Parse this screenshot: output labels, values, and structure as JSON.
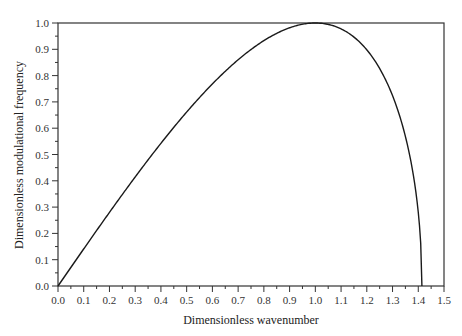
{
  "chart_data": {
    "type": "line",
    "title": "",
    "xlabel": "Dimensionless wavenumber",
    "ylabel": "Dimensionless modulational frequency",
    "xlim": [
      0.0,
      1.5
    ],
    "ylim": [
      0.0,
      1.0
    ],
    "grid": false,
    "legend": null,
    "x_ticks": [
      "0.0",
      "0.1",
      "0.2",
      "0.3",
      "0.4",
      "0.5",
      "0.6",
      "0.7",
      "0.8",
      "0.9",
      "1.0",
      "1.1",
      "1.2",
      "1.3",
      "1.4",
      "1.5"
    ],
    "y_ticks": [
      "0.0",
      "0.1",
      "0.2",
      "0.3",
      "0.4",
      "0.5",
      "0.6",
      "0.7",
      "0.8",
      "0.9",
      "1.0"
    ],
    "series": [
      {
        "name": "modulational frequency",
        "x": [
          0.0,
          0.1,
          0.2,
          0.3,
          0.4,
          0.5,
          0.6,
          0.7,
          0.8,
          0.9,
          1.0,
          1.1,
          1.2,
          1.3,
          1.35,
          1.4,
          1.414
        ],
        "y": [
          0.0,
          0.141,
          0.28,
          0.412,
          0.533,
          0.661,
          0.768,
          0.86,
          0.933,
          0.983,
          1.0,
          0.97,
          0.904,
          0.724,
          0.568,
          0.28,
          0.0
        ]
      }
    ]
  },
  "layout": {
    "line_color": "#1a1a1a",
    "axis_color": "#333333"
  }
}
